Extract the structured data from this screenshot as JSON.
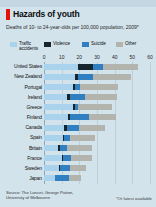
{
  "header": {
    "title": "Hazards of youth",
    "subtitle": "Deaths of 10- to 24-year-olds per 100,000 population, 2009*"
  },
  "footer": {
    "source": "Source: The Lancet, George Patton, University of Melbourne",
    "footnote": "*Or latest available"
  },
  "colors": {
    "traffic": "#a9d3ec",
    "violence": "#16242e",
    "suicide": "#2f7fc1",
    "other": "#b4b4ae",
    "background": "#d3e3ec",
    "grid": "#bcd0dc",
    "accent": "#e3120b"
  },
  "chart_data": {
    "type": "bar",
    "orientation": "horizontal",
    "stacked": true,
    "title": "Hazards of youth",
    "subtitle": "Deaths of 10- to 24-year-olds per 100,000 population, 2009*",
    "xlabel": "",
    "ylabel": "",
    "xlim": [
      0,
      60
    ],
    "xticks": [
      0,
      10,
      20,
      30,
      40,
      50,
      60
    ],
    "grid": true,
    "legend_position": "top",
    "categories": [
      "United States",
      "New Zealand",
      "Portugal",
      "Ireland",
      "Greece",
      "Finland",
      "Canada",
      "Spain",
      "Britain",
      "France",
      "Sweden",
      "Japan"
    ],
    "series": [
      {
        "name": "Traffic accidents",
        "color": "#a9d3ec",
        "values": [
          19.5,
          17.5,
          16.5,
          13.0,
          16.5,
          13.5,
          11.5,
          10.5,
          8.0,
          10.0,
          8.5,
          6.0
        ]
      },
      {
        "name": "Violence",
        "color": "#16242e",
        "values": [
          8.0,
          1.5,
          1.0,
          1.5,
          1.0,
          1.5,
          1.5,
          1.0,
          1.0,
          0.8,
          0.8,
          0.4
        ]
      },
      {
        "name": "Suicide",
        "color": "#2f7fc1",
        "values": [
          6.0,
          8.5,
          3.0,
          9.0,
          2.0,
          10.5,
          7.0,
          3.0,
          4.0,
          4.5,
          5.5,
          7.5
        ]
      },
      {
        "name": "Other",
        "color": "#b4b4ae",
        "values": [
          20.0,
          22.0,
          21.5,
          18.0,
          19.0,
          15.0,
          14.5,
          14.5,
          14.0,
          12.0,
          9.0,
          7.0
        ]
      }
    ],
    "totals": [
      53.5,
      49.5,
      42.0,
      41.5,
      38.5,
      40.5,
      34.5,
      29.0,
      27.0,
      27.3,
      23.8,
      20.9
    ]
  }
}
